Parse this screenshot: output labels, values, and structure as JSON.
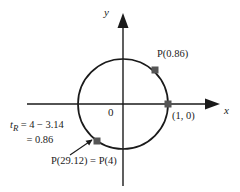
{
  "figure": {
    "type": "unit-circle-diagram",
    "stroke_color": "#1a1a1a",
    "marker_color": "#555555",
    "background": "#ffffff"
  },
  "axes": {
    "x_label": "x",
    "y_label": "y",
    "origin_label": "0"
  },
  "circle": {
    "center_x": 123,
    "center_y": 104,
    "radius": 45
  },
  "labels": {
    "point_upper": "P(0.86)",
    "point_right": "(1, 0)",
    "point_lower": "P(29.12) = P(4)",
    "equation_line1_var": "t",
    "equation_line1_sub": "R",
    "equation_line1_eq": "=",
    "equation_line1_a": "4",
    "equation_line1_minus": "−",
    "equation_line1_b": "3.14",
    "equation_line2_eq": "=",
    "equation_line2_val": "0.86"
  },
  "markers": [
    {
      "name": "point-0-86",
      "x": 155,
      "y": 70
    },
    {
      "name": "point-1-0",
      "x": 168,
      "y": 104
    },
    {
      "name": "point-4",
      "x": 97,
      "y": 141
    }
  ]
}
